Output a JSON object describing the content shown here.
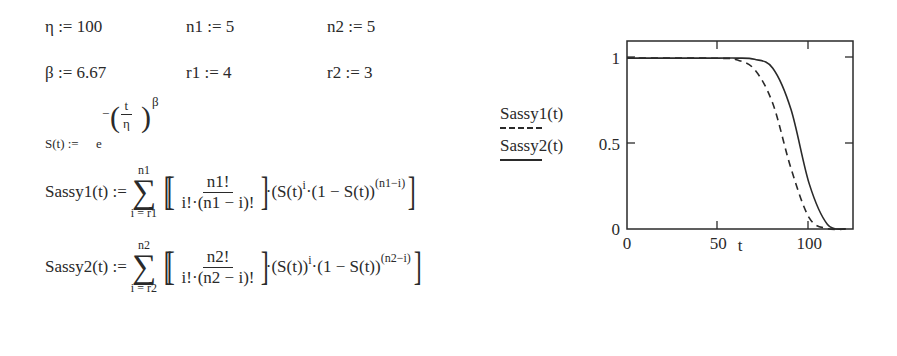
{
  "definitions": {
    "eta": {
      "name": "η",
      "op": ":=",
      "value": "100"
    },
    "beta": {
      "name": "β",
      "op": ":=",
      "value": "6.67"
    },
    "n1": {
      "name": "n1",
      "op": ":=",
      "value": "5"
    },
    "r1": {
      "name": "r1",
      "op": ":=",
      "value": "4"
    },
    "n2": {
      "name": "n2",
      "op": ":=",
      "value": "5"
    },
    "r2": {
      "name": "r2",
      "op": ":=",
      "value": "3"
    }
  },
  "survival": {
    "lhs": "S(t) :=",
    "base": "e",
    "neg": "−",
    "frac_num": "t",
    "frac_den": "η",
    "exp": "β"
  },
  "sassy1": {
    "lhs": "Sassy1(t) :=",
    "sum_upper": "n1",
    "sum_lower": "i = r1",
    "frac_num": "n1!",
    "frac_den": "i!·(n1 − i)!",
    "tail_a": "·(S(t)",
    "tail_a_exp": "i",
    "tail_b": "·(1 − S(t))",
    "tail_b_exp": "(n1−i)"
  },
  "sassy2": {
    "lhs": "Sassy2(t) :=",
    "sum_upper": "n2",
    "sum_lower": "i = r2",
    "frac_num": "n2!",
    "frac_den": "i!·(n2 − i)!",
    "tail_a": "·(S(t))",
    "tail_a_exp": "i",
    "tail_b": "·(1 − S(t))",
    "tail_b_exp": "(n2−i)"
  },
  "legend": {
    "series1": "Sassy1(t)",
    "series2": "Sassy2(t)"
  },
  "chart_data": {
    "type": "line",
    "title": "",
    "xlabel": "t",
    "ylabel": "",
    "xlim": [
      0,
      124
    ],
    "ylim": [
      0,
      1.1
    ],
    "x_ticks": [
      "0",
      "50",
      "100"
    ],
    "y_ticks": [
      "0",
      "0.5",
      "1"
    ],
    "grid": false,
    "legend_position": "left of plot",
    "x": [
      0,
      50,
      60,
      70,
      80,
      90,
      100,
      110,
      120
    ],
    "series": [
      {
        "name": "Sassy1(t)",
        "style": "dashed",
        "values": [
          1.0,
          0.999,
          0.99,
          0.933,
          0.734,
          0.354,
          0.065,
          0.002,
          0.0
        ]
      },
      {
        "name": "Sassy2(t)",
        "style": "solid",
        "values": [
          1.0,
          1.0,
          1.0,
          0.993,
          0.941,
          0.699,
          0.264,
          0.027,
          0.0
        ]
      }
    ]
  }
}
